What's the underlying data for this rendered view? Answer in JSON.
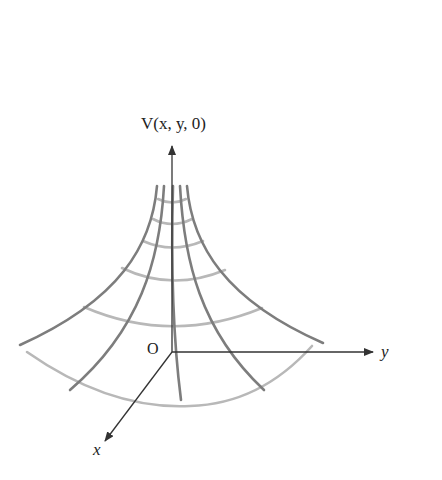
{
  "diagram": {
    "type": "3d-surface-sketch",
    "labels": {
      "vertical_axis": "V(x, y, 0)",
      "origin": "O",
      "y_axis": "y",
      "x_axis": "x"
    },
    "colors": {
      "axes": "#333333",
      "radial_curves": "#7a7a7a",
      "level_arcs": "#b5b5b5",
      "text": "#222222"
    },
    "geometry": {
      "origin": [
        172,
        352
      ],
      "vertical_axis_top": [
        172,
        144
      ],
      "y_axis_end": [
        374,
        352
      ],
      "x_axis_end": [
        104,
        442
      ],
      "radial_curves": [
        {
          "top": [
            157,
            186
          ],
          "bottom": [
            20,
            345
          ]
        },
        {
          "top": [
            164,
            186
          ],
          "bottom": [
            70,
            390
          ]
        },
        {
          "top": [
            172,
            186
          ],
          "bottom": [
            181,
            400
          ]
        },
        {
          "top": [
            180,
            186
          ],
          "bottom": [
            264,
            390
          ]
        },
        {
          "top": [
            187,
            186
          ],
          "bottom": [
            323,
            343
          ]
        }
      ],
      "level_arcs": [
        {
          "y_center": 204,
          "half_width": 16
        },
        {
          "y_center": 225,
          "half_width": 22
        },
        {
          "y_center": 249,
          "half_width": 33
        },
        {
          "y_center": 281,
          "half_width": 52
        },
        {
          "y_center": 328,
          "half_width": 88
        },
        {
          "y_center": 387,
          "half_width": 145
        }
      ]
    }
  }
}
